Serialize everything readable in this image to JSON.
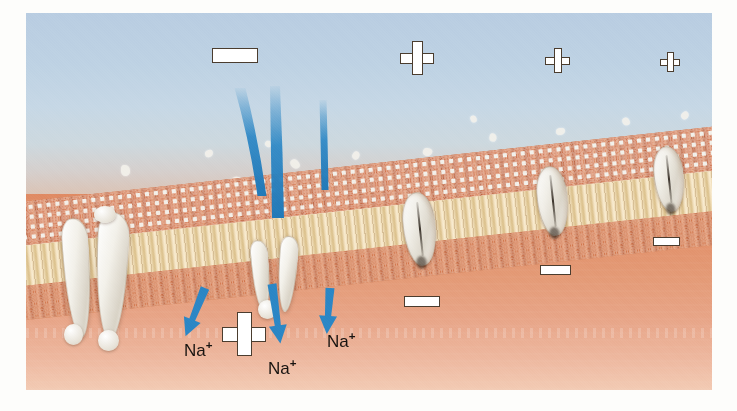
{
  "figure": {
    "regions": {
      "extracellular_label": "extracellular fluid",
      "cytoplasm_label": "cytoplasm",
      "membrane_label": "phospholipid bilayer"
    },
    "colors": {
      "extracellular_top": "#b9cde2",
      "extracellular_bottom": "#e0a88e",
      "cytoplasm_top": "#e08a63",
      "cytoplasm_bottom": "#f3cbb4",
      "lipid_head": "#c8603a",
      "lipid_tail": "#f0dcb4",
      "protein": "#f4f2ec",
      "ion_stream": "#2b86c5",
      "arrow": "#2b86c5",
      "symbol_fill": "#ffffff",
      "symbol_stroke": "#4a3c2e",
      "label_text": "#171310",
      "page_background": "#fdfdfb"
    }
  },
  "charges": {
    "outside": [
      {
        "sign": "minus",
        "x": 212,
        "y": 48,
        "w": 46,
        "h": 15,
        "thickness": 15
      },
      {
        "sign": "plus",
        "x": 400,
        "y": 41,
        "size": 34
      },
      {
        "sign": "plus",
        "x": 545,
        "y": 48,
        "size": 25
      },
      {
        "sign": "plus",
        "x": 660,
        "y": 52,
        "size": 20
      }
    ],
    "inside": [
      {
        "sign": "plus",
        "x": 222,
        "y": 312,
        "size": 44
      },
      {
        "sign": "minus",
        "x": 404,
        "y": 296,
        "w": 36,
        "h": 11
      },
      {
        "sign": "minus",
        "x": 540,
        "y": 265,
        "w": 31,
        "h": 10
      },
      {
        "sign": "minus",
        "x": 653,
        "y": 237,
        "w": 27,
        "h": 9
      }
    ],
    "signs": {
      "plus": "+",
      "minus": "−"
    }
  },
  "ion_labels": [
    {
      "text": "Na",
      "charge": "+",
      "x": 184,
      "y": 340,
      "size": 17
    },
    {
      "text": "Na",
      "charge": "+",
      "x": 268,
      "y": 358,
      "size": 17
    },
    {
      "text": "Na",
      "charge": "+",
      "x": 327,
      "y": 331,
      "size": 17
    }
  ],
  "streams": [
    {
      "name": "stream-left",
      "top_x": 240,
      "top_y": 88,
      "bottom_x": 262,
      "bottom_y": 196,
      "width_top": 11,
      "width_bottom": 9
    },
    {
      "name": "stream-center",
      "top_x": 275,
      "top_y": 86,
      "bottom_x": 278,
      "bottom_y": 218,
      "width_top": 10,
      "width_bottom": 12
    },
    {
      "name": "stream-right",
      "top_x": 323,
      "top_y": 100,
      "bottom_x": 325,
      "bottom_y": 190,
      "width_top": 7,
      "width_bottom": 7
    }
  ],
  "arrows": [
    {
      "name": "arrow-left",
      "x": 205,
      "y": 288,
      "angle": 22,
      "length": 52
    },
    {
      "name": "arrow-center",
      "x": 272,
      "y": 284,
      "angle": -8,
      "length": 60
    },
    {
      "name": "arrow-right",
      "x": 330,
      "y": 288,
      "angle": 4,
      "length": 46
    }
  ],
  "channels": [
    {
      "name": "open-gated-channel",
      "state": "open",
      "x": 60,
      "y": 212,
      "w": 96,
      "h": 140
    },
    {
      "name": "flow-channel",
      "state": "open",
      "x": 252,
      "y": 232,
      "w": 44,
      "h": 86
    },
    {
      "name": "closed-channel-1",
      "state": "closed",
      "x": 403,
      "y": 192,
      "w": 31,
      "h": 72
    },
    {
      "name": "closed-channel-2",
      "state": "closed",
      "x": 537,
      "y": 166,
      "w": 29,
      "h": 68
    },
    {
      "name": "closed-channel-3",
      "state": "closed",
      "x": 654,
      "y": 146,
      "w": 28,
      "h": 64
    }
  ],
  "flecks": [
    {
      "x": 120,
      "y": 166,
      "w": 11,
      "h": 9
    },
    {
      "x": 163,
      "y": 188,
      "w": 9,
      "h": 8
    },
    {
      "x": 205,
      "y": 150,
      "w": 8,
      "h": 7
    },
    {
      "x": 231,
      "y": 177,
      "w": 12,
      "h": 10
    },
    {
      "x": 290,
      "y": 160,
      "w": 10,
      "h": 8
    },
    {
      "x": 315,
      "y": 183,
      "w": 9,
      "h": 7
    },
    {
      "x": 352,
      "y": 152,
      "w": 8,
      "h": 7
    },
    {
      "x": 386,
      "y": 172,
      "w": 11,
      "h": 9
    },
    {
      "x": 423,
      "y": 148,
      "w": 9,
      "h": 8
    },
    {
      "x": 452,
      "y": 170,
      "w": 12,
      "h": 9
    },
    {
      "x": 489,
      "y": 134,
      "w": 8,
      "h": 7
    },
    {
      "x": 519,
      "y": 157,
      "w": 10,
      "h": 8
    },
    {
      "x": 556,
      "y": 128,
      "w": 9,
      "h": 7
    },
    {
      "x": 588,
      "y": 148,
      "w": 11,
      "h": 9
    },
    {
      "x": 622,
      "y": 118,
      "w": 8,
      "h": 7
    },
    {
      "x": 651,
      "y": 138,
      "w": 10,
      "h": 8
    },
    {
      "x": 681,
      "y": 112,
      "w": 8,
      "h": 7
    },
    {
      "x": 93,
      "y": 196,
      "w": 9,
      "h": 8
    },
    {
      "x": 265,
      "y": 141,
      "w": 7,
      "h": 6
    },
    {
      "x": 470,
      "y": 116,
      "w": 7,
      "h": 6
    }
  ]
}
